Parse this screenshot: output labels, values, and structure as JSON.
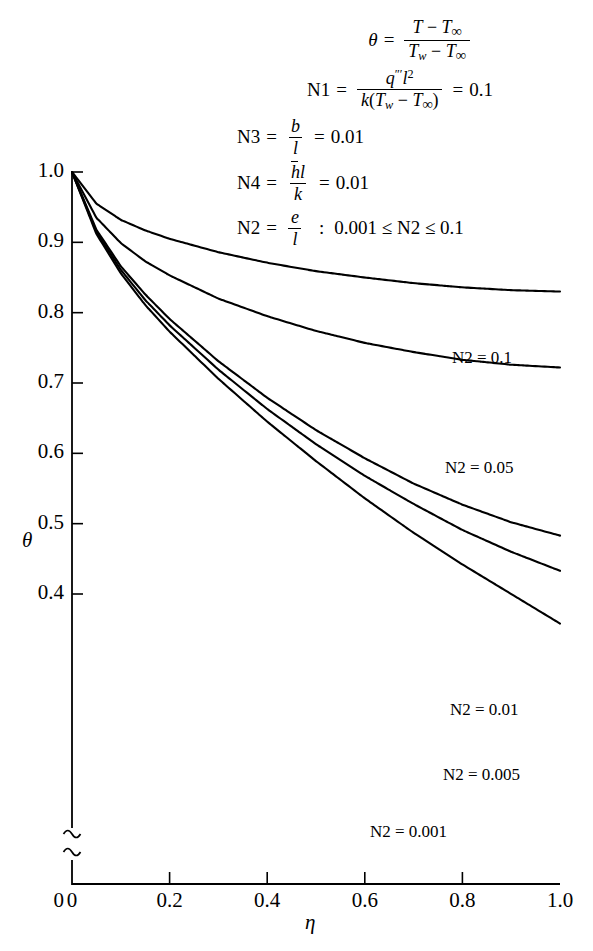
{
  "figure": {
    "notation": {
      "theta_def": {
        "lhs": "θ",
        "numerator": "T − T∞",
        "denominator": "Tw − T∞"
      },
      "n1": {
        "label": "N1",
        "numerator": "q‴l²",
        "denominator": "k(Tw − T∞)",
        "value": "0.1"
      },
      "n3": {
        "label": "N3",
        "numerator": "b",
        "denominator": "l",
        "value": "0.01"
      },
      "n4": {
        "label": "N4",
        "numerator": "h̄l",
        "denominator": "k",
        "value": "0.01"
      },
      "n2": {
        "label": "N2",
        "numerator": "e",
        "denominator": "l",
        "separator": ":",
        "range": "0.001 ≤ N2 ≤ 0.1"
      }
    }
  },
  "chart_data": {
    "type": "line",
    "title": "",
    "xlabel": "η",
    "ylabel": "θ",
    "xlim": [
      0,
      1.0
    ],
    "ylim": [
      0.33,
      1.0
    ],
    "y_axis_break": true,
    "y_break_below": 0.4,
    "y_origin_label": "0",
    "grid": false,
    "legend_position": "inline-right",
    "xticks": [
      0,
      0.2,
      0.4,
      0.6,
      0.8,
      1.0
    ],
    "xtick_labels": [
      "0",
      "0.2",
      "0.4",
      "0.6",
      "0.8",
      "1.0"
    ],
    "yticks": [
      1.0,
      0.9,
      0.8,
      0.7,
      0.6,
      0.5,
      0.4
    ],
    "ytick_labels": [
      "1.0",
      "0.9",
      "0.8",
      "0.7",
      "0.6",
      "0.5",
      "0.4"
    ],
    "x": [
      0,
      0.05,
      0.1,
      0.15,
      0.2,
      0.3,
      0.4,
      0.5,
      0.6,
      0.7,
      0.8,
      0.9,
      1.0
    ],
    "series": [
      {
        "name": "N2 = 0.1",
        "label": "N2 = 0.1",
        "values": [
          1.0,
          0.955,
          0.932,
          0.917,
          0.905,
          0.886,
          0.871,
          0.859,
          0.85,
          0.842,
          0.836,
          0.832,
          0.83
        ]
      },
      {
        "name": "N2 = 0.05",
        "label": "N2 = 0.05",
        "values": [
          1.0,
          0.935,
          0.899,
          0.873,
          0.853,
          0.82,
          0.795,
          0.774,
          0.757,
          0.744,
          0.733,
          0.726,
          0.722
        ]
      },
      {
        "name": "N2 = 0.01",
        "label": "N2 = 0.01",
        "values": [
          1.0,
          0.918,
          0.866,
          0.826,
          0.791,
          0.731,
          0.679,
          0.633,
          0.593,
          0.557,
          0.527,
          0.502,
          0.483
        ]
      },
      {
        "name": "N2 = 0.005",
        "label": "N2 = 0.005",
        "values": [
          1.0,
          0.915,
          0.861,
          0.818,
          0.782,
          0.719,
          0.663,
          0.613,
          0.568,
          0.528,
          0.491,
          0.46,
          0.433
        ]
      },
      {
        "name": "N2 = 0.001",
        "label": "N2 = 0.001",
        "values": [
          1.0,
          0.912,
          0.856,
          0.811,
          0.773,
          0.706,
          0.645,
          0.589,
          0.536,
          0.487,
          0.442,
          0.4,
          0.358
        ]
      }
    ]
  }
}
